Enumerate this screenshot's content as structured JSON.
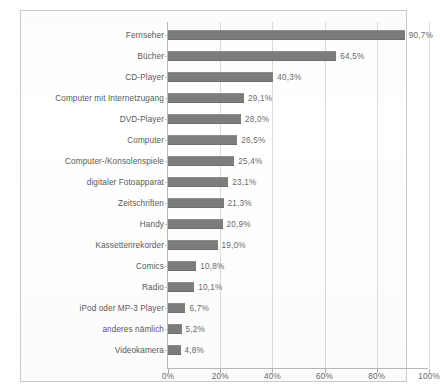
{
  "chart_data": {
    "type": "bar",
    "orientation": "horizontal",
    "title": "",
    "xlabel": "",
    "ylabel": "",
    "xlim": [
      0,
      100
    ],
    "xticks": [
      "0%",
      "20%",
      "40%",
      "60%",
      "80%",
      "100%"
    ],
    "xtick_values": [
      0,
      20,
      40,
      60,
      80,
      100
    ],
    "grid": "vertical",
    "legend": "none",
    "value_suffix": "%",
    "categories": [
      "Fernseher",
      "Bücher",
      "CD-Player",
      "Computer mit Internetzugang",
      "DVD-Player",
      "Computer",
      "Computer-/Konsolenspiele",
      "digitaler Fotoapparat",
      "Zeitschriften",
      "Handy",
      "Kassettenrekorder",
      "Comics",
      "Radio",
      "iPod oder MP-3 Player",
      "anderes nämlich",
      "Videokamera"
    ],
    "values": [
      90.7,
      64.5,
      40.3,
      29.1,
      28.0,
      26.5,
      25.4,
      23.1,
      21.3,
      20.9,
      19.0,
      10.8,
      10.1,
      6.7,
      5.2,
      4.8
    ],
    "value_labels": [
      "90,7%",
      "64,5%",
      "40,3%",
      "29,1%",
      "28,0%",
      "26,5%",
      "25,4%",
      "23,1%",
      "21,3%",
      "20,9%",
      "19,0%",
      "10,8%",
      "10,1%",
      "6,7%",
      "5,2%",
      "4,8%"
    ],
    "bar_color": "#7d7d7d",
    "grid_color": "#dcdcdc",
    "axis_color": "#b8b8b8",
    "text_color": "#5a5a5a",
    "background_color": "#ffffff"
  }
}
